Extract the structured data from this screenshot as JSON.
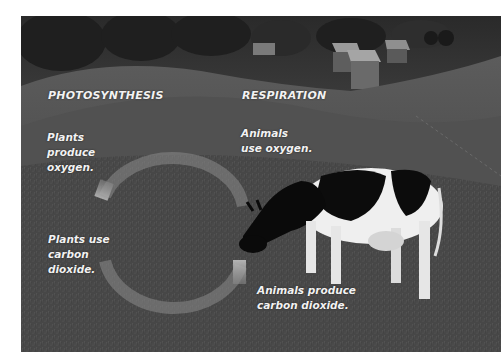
{
  "headings": {
    "left": "PHOTOSYNTHESIS",
    "right": "RESPIRATION"
  },
  "labels": {
    "plants_produce": [
      "Plants",
      "produce",
      "oxygen."
    ],
    "animals_use": [
      "Animals",
      "use oxygen."
    ],
    "plants_use": [
      "Plants use",
      "carbon",
      "dioxide."
    ],
    "animals_produce": [
      "Animals produce",
      "carbon dioxide."
    ]
  },
  "scene": {
    "background": "grazing-cow-on-hillside-farm",
    "subjects": [
      "cow",
      "farm-buildings",
      "trees",
      "pasture"
    ],
    "cycle_arrows": [
      "top-arc",
      "bottom-arc"
    ]
  },
  "colors": {
    "text": "#f2f2f2",
    "arc": "#8a8a8a",
    "grass": "#4a4a4a",
    "page": "#ffffff"
  }
}
